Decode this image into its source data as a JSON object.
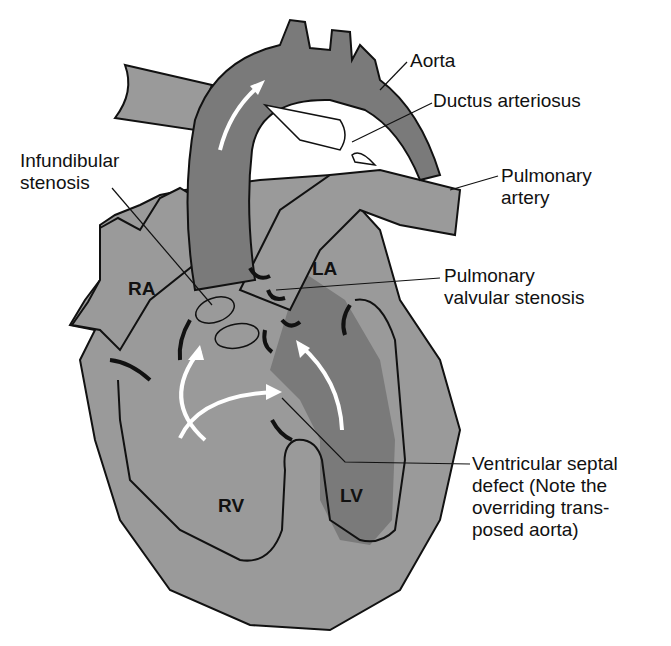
{
  "figure": {
    "colors": {
      "light_tissue": "#9a9a9a",
      "dark_tissue": "#7a7a7a",
      "outline": "#111111",
      "arrow": "#ffffff",
      "background": "#ffffff"
    }
  },
  "chambers": {
    "ra": "RA",
    "la": "LA",
    "rv": "RV",
    "lv": "LV"
  },
  "labels": {
    "aorta": "Aorta",
    "ductus": "Ductus arteriosus",
    "pulmonary_artery": "Pulmonary\nartery",
    "infundibular": "Infundibular\nstenosis",
    "pulm_valvular": "Pulmonary\nvalvular stenosis",
    "vsd": "Ventricular septal\ndefect (Note the\noverriding trans-\nposed aorta)"
  }
}
